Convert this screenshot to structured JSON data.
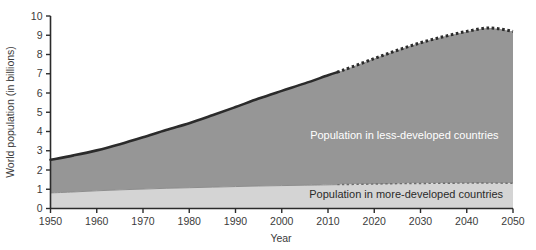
{
  "chart_data": {
    "type": "area",
    "title": "",
    "xlabel": "Year",
    "ylabel": "World population (in billions)",
    "xlim": [
      1950,
      2050
    ],
    "ylim": [
      0,
      10
    ],
    "grid": false,
    "legend_position": "inline-annotation",
    "stacked": true,
    "projection_start_year": 2012,
    "x": [
      1950,
      1955,
      1960,
      1965,
      1970,
      1975,
      1980,
      1985,
      1990,
      1995,
      2000,
      2005,
      2010,
      2012,
      2015,
      2020,
      2025,
      2030,
      2035,
      2040,
      2045,
      2050
    ],
    "xticks": [
      1950,
      1960,
      1970,
      1980,
      1990,
      2000,
      2010,
      2020,
      2030,
      2040,
      2050
    ],
    "xticklabels": [
      "1950",
      "1960",
      "1970",
      "1980",
      "1990",
      "2000",
      "2010",
      "2020",
      "2030",
      "2040",
      "2050"
    ],
    "yticks": [
      0,
      1,
      2,
      3,
      4,
      5,
      6,
      7,
      8,
      9,
      10
    ],
    "yticklabels": [
      "0",
      "1",
      "2",
      "3",
      "4",
      "5",
      "6",
      "7",
      "8",
      "9",
      "10"
    ],
    "series": [
      {
        "name": "Population in more-developed countries",
        "color": "#d4d4d4",
        "values": [
          0.81,
          0.86,
          0.92,
          0.97,
          1.01,
          1.05,
          1.08,
          1.11,
          1.14,
          1.17,
          1.19,
          1.21,
          1.23,
          1.24,
          1.25,
          1.27,
          1.29,
          1.3,
          1.31,
          1.32,
          1.32,
          1.31
        ]
      },
      {
        "name": "Population in less-developed countries",
        "color": "#969696",
        "values": [
          1.72,
          1.9,
          2.1,
          2.37,
          2.69,
          3.03,
          3.35,
          3.73,
          4.13,
          4.54,
          4.92,
          5.29,
          5.69,
          5.84,
          6.09,
          6.52,
          6.93,
          7.31,
          7.62,
          7.88,
          8.06,
          7.89
        ]
      }
    ],
    "totals": [
      2.53,
      2.76,
      3.02,
      3.34,
      3.7,
      4.08,
      4.43,
      4.84,
      5.27,
      5.71,
      6.11,
      6.5,
      6.92,
      7.08,
      7.34,
      7.79,
      8.22,
      8.61,
      8.93,
      9.2,
      9.38,
      9.2
    ],
    "annotations": [
      {
        "text": "Population in less-developed countries",
        "x_year": 2030,
        "y_value": 3.6,
        "color": "#ffffff"
      },
      {
        "text": "Population in more-developed countries",
        "x_year": 2031,
        "y_value": 0.55,
        "color": "#2a2a2a"
      }
    ],
    "line_style_note": "solid up to 2012 (historical), dotted after 2012 (projection)"
  },
  "axes": {
    "y_axis_title": "World population (in billions)",
    "x_axis_title": "Year"
  },
  "colors": {
    "less_developed_fill": "#969696",
    "more_developed_fill": "#d4d4d4",
    "axis": "#2b2b2b",
    "top_line": "#2b2b2b",
    "tick_text": "#3b3b3b",
    "background": "#ffffff"
  }
}
